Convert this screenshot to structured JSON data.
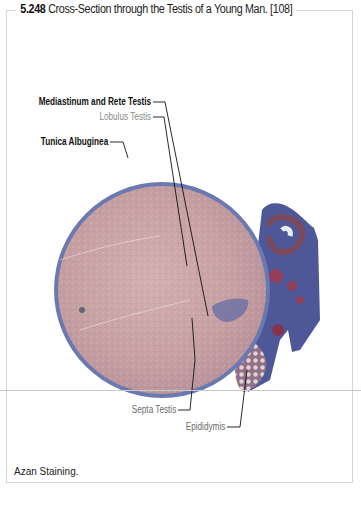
{
  "figure": {
    "number": "5.248",
    "title": "Cross-Section through the Testis of a Young Man. [108]",
    "caption": "Azan Staining.",
    "labels": [
      {
        "id": "mediastinum",
        "text": "Mediastinum and Rete Testis",
        "weight": "bold"
      },
      {
        "id": "lobulus",
        "text": "Lobulus Testis",
        "weight": "light"
      },
      {
        "id": "tunica",
        "text": "Tunica Albuginea",
        "weight": "bold"
      },
      {
        "id": "septa",
        "text": "Septa Testis",
        "weight": "regular"
      },
      {
        "id": "epididymis",
        "text": "Epididymis",
        "weight": "regular"
      }
    ],
    "colors": {
      "parenchyma": "#c9a3a6",
      "capsule": "#6e7fb3",
      "connective": "#5b5f9a",
      "vessels": "#a23a4a",
      "frame": "#d4d4d4"
    }
  }
}
